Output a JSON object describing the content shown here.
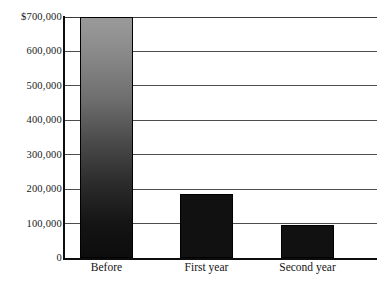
{
  "chart_data": {
    "type": "bar",
    "title": "",
    "xlabel": "",
    "ylabel": "",
    "categories": [
      "Before",
      "First year",
      "Second year"
    ],
    "values": [
      700000,
      185000,
      97000
    ],
    "ylim": [
      0,
      700000
    ],
    "ytick_values": [
      0,
      100000,
      200000,
      300000,
      400000,
      500000,
      600000,
      700000
    ],
    "ytick_labels": [
      "0",
      "100,000",
      "200,000",
      "300,000",
      "400,000",
      "500,000",
      "600,000",
      "$700,000"
    ],
    "grid": true,
    "legend": null,
    "bar_styles": [
      "gradient-gray-to-black",
      "solid-black",
      "solid-black"
    ],
    "colors": {
      "gradient_top": "#9a9a9a",
      "gradient_bottom": "#0d0d0d",
      "bar_solid": "#111111",
      "axis": "#0d0d0d",
      "gridline": "#4d4d4d",
      "background": "#ffffff",
      "text": "#141414"
    }
  },
  "axis_geometry": {
    "plot_left": 63,
    "plot_right": 377,
    "plot_top": 17,
    "plot_bottom": 258,
    "bar_left_positions": [
      80,
      180,
      281
    ],
    "bar_width": 53
  }
}
